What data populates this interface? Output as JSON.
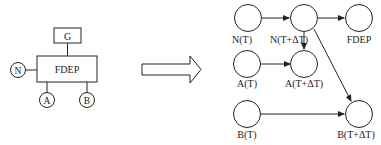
{
  "left_diagram": {
    "gate_label": "FDEP",
    "trigger_label": "G",
    "inputs": [
      {
        "id": "N",
        "label": "N"
      },
      {
        "id": "A",
        "label": "A"
      },
      {
        "id": "B",
        "label": "B"
      }
    ]
  },
  "transform_arrow": {
    "direction": "right"
  },
  "right_diagram": {
    "nodes": [
      {
        "id": "N_T",
        "label": "N(T)"
      },
      {
        "id": "N_TdT",
        "label": "N(T+ΔT)"
      },
      {
        "id": "FDEP",
        "label": "FDEP"
      },
      {
        "id": "A_T",
        "label": "A(T)"
      },
      {
        "id": "A_TdT",
        "label": "A(T+ΔT)"
      },
      {
        "id": "B_T",
        "label": "B(T)"
      },
      {
        "id": "B_TdT",
        "label": "B(T+ΔT)"
      }
    ],
    "edges": [
      {
        "from": "N_T",
        "to": "N_TdT"
      },
      {
        "from": "N_TdT",
        "to": "FDEP"
      },
      {
        "from": "N_TdT",
        "to": "A_TdT"
      },
      {
        "from": "N_TdT",
        "to": "B_TdT"
      },
      {
        "from": "A_T",
        "to": "A_TdT"
      },
      {
        "from": "B_T",
        "to": "B_TdT"
      }
    ]
  },
  "colors": {
    "stroke": "#222222",
    "background": "#ffffff"
  }
}
